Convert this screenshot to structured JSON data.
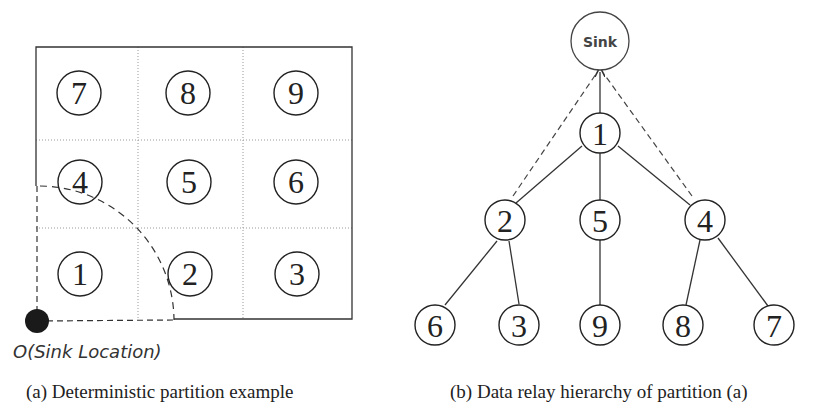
{
  "panel_a": {
    "caption": "(a) Deterministic partition example",
    "origin_label": "O(Sink Location)",
    "grid": {
      "rows": 3,
      "cols": 3,
      "cells": [
        [
          "7",
          "8",
          "9"
        ],
        [
          "4",
          "5",
          "6"
        ],
        [
          "1",
          "2",
          "3"
        ]
      ]
    }
  },
  "panel_b": {
    "caption": "(b) Data relay hierarchy of partition (a)",
    "sink_label": "Sink",
    "nodes": {
      "n1": "1",
      "n2": "2",
      "n5": "5",
      "n4": "4",
      "n6": "6",
      "n3": "3",
      "n9": "9",
      "n8": "8",
      "n7": "7"
    },
    "edges": [
      {
        "from": "1",
        "to": "Sink",
        "style": "solid-arrow"
      },
      {
        "from": "2",
        "to": "Sink",
        "style": "dashed"
      },
      {
        "from": "4",
        "to": "Sink",
        "style": "dashed"
      },
      {
        "from": "1",
        "to": "2",
        "style": "solid"
      },
      {
        "from": "1",
        "to": "5",
        "style": "solid"
      },
      {
        "from": "1",
        "to": "4",
        "style": "solid"
      },
      {
        "from": "2",
        "to": "6",
        "style": "solid"
      },
      {
        "from": "2",
        "to": "3",
        "style": "solid"
      },
      {
        "from": "5",
        "to": "9",
        "style": "solid"
      },
      {
        "from": "4",
        "to": "8",
        "style": "solid"
      },
      {
        "from": "4",
        "to": "7",
        "style": "solid"
      }
    ]
  }
}
